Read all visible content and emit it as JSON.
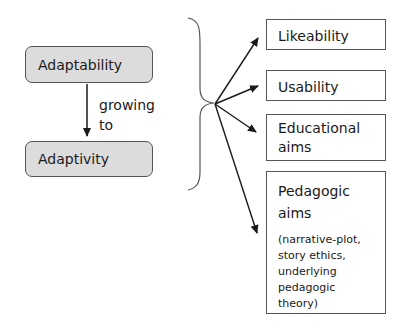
{
  "left": {
    "top_box": "Adaptability",
    "bottom_box": "Adaptivity",
    "arrow_label_line1": "growing",
    "arrow_label_line2": "to"
  },
  "right": {
    "boxes": [
      {
        "title": "Likeability"
      },
      {
        "title": "Usability"
      },
      {
        "title_line1": "Educational",
        "title_line2": "aims"
      },
      {
        "title_line1": "Pedagogic",
        "title_line2": "aims",
        "note_lines": [
          "(narrative-plot,",
          "story ethics,",
          "underlying",
          "pedagogic",
          "theory)"
        ]
      }
    ]
  },
  "colors": {
    "rounded_fill": "#dcdcdc",
    "border": "#555555",
    "arrow": "#1a1a1a"
  }
}
